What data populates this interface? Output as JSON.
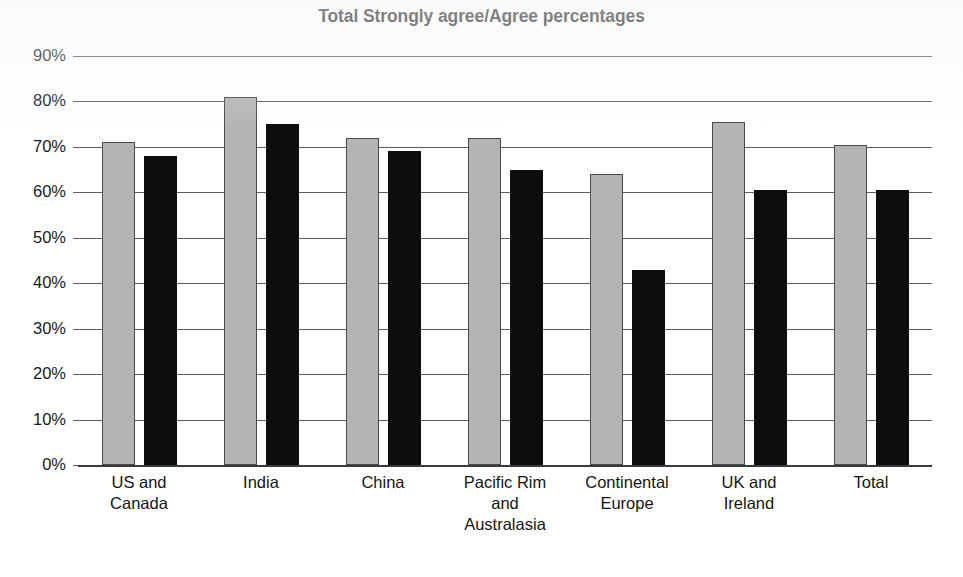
{
  "chart_data": {
    "type": "bar",
    "title": "Total Strongly agree/Agree percentages",
    "xlabel": "",
    "ylabel": "",
    "ylim": [
      0,
      90
    ],
    "grid": true,
    "legend": "none",
    "tick_suffix": "%",
    "yticks": [
      "0%",
      "10%",
      "20%",
      "30%",
      "40%",
      "50%",
      "60%",
      "70%",
      "80%",
      "90%"
    ],
    "ytick_values": [
      0,
      10,
      20,
      30,
      40,
      50,
      60,
      70,
      80,
      90
    ],
    "categories": [
      "US and Canada",
      "India",
      "China",
      "Pacific Rim and Australasia",
      "Continental Europe",
      "UK and Ireland",
      "Total"
    ],
    "category_lines": [
      [
        "US and",
        "Canada"
      ],
      [
        "India"
      ],
      [
        "China"
      ],
      [
        "Pacific Rim",
        "and",
        "Australasia"
      ],
      [
        "Continental",
        "Europe"
      ],
      [
        "UK and",
        "Ireland"
      ],
      [
        "Total"
      ]
    ],
    "series": [
      {
        "name": "Series 1",
        "color": "#b4b4b4",
        "values": [
          71,
          81,
          72,
          72,
          64,
          75.5,
          70.5
        ]
      },
      {
        "name": "Series 2",
        "color": "#0d0d0d",
        "values": [
          68,
          75,
          69,
          65,
          43,
          60.5,
          60.5
        ]
      }
    ]
  },
  "colors": {
    "series_a": "#b4b4b4",
    "series_b": "#0d0d0d",
    "gridline": "#5c5c5c",
    "axis": "#3a3a3a",
    "text": "#151515",
    "background": "#ffffff"
  }
}
